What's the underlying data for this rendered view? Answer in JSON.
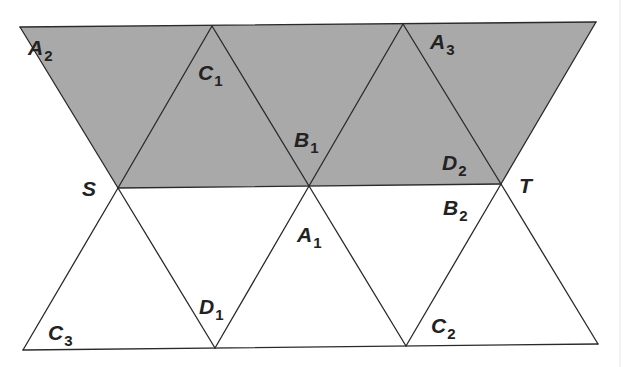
{
  "figure": {
    "colors": {
      "shade": "#a9a9a9",
      "line": "#2a2a2a",
      "text": "#222222",
      "background": "#ffffff"
    },
    "vertices": {
      "top_left": [
        20,
        27
      ],
      "top_apex_1": [
        212,
        26
      ],
      "top_apex_2": [
        403,
        24
      ],
      "top_right": [
        596,
        22
      ],
      "S": [
        118,
        188
      ],
      "M": [
        309,
        186
      ],
      "T": [
        501,
        184
      ],
      "bottom_left": [
        23,
        350
      ],
      "bottom_1": [
        215,
        348
      ],
      "bottom_2": [
        406,
        346
      ],
      "bottom_right": [
        598,
        344
      ]
    },
    "labels": [
      {
        "id": "A2",
        "letter": "A",
        "sub": "2",
        "x": 28,
        "y": 55
      },
      {
        "id": "C1",
        "letter": "C",
        "sub": "1",
        "x": 198,
        "y": 80
      },
      {
        "id": "B1",
        "letter": "B",
        "sub": "1",
        "x": 294,
        "y": 147
      },
      {
        "id": "A3",
        "letter": "A",
        "sub": "3",
        "x": 430,
        "y": 49
      },
      {
        "id": "D2",
        "letter": "D",
        "sub": "2",
        "x": 442,
        "y": 170
      },
      {
        "id": "S",
        "letter": "S",
        "sub": "",
        "x": 82,
        "y": 196
      },
      {
        "id": "T",
        "letter": "T",
        "sub": "",
        "x": 519,
        "y": 193
      },
      {
        "id": "B2",
        "letter": "B",
        "sub": "2",
        "x": 443,
        "y": 215
      },
      {
        "id": "A1",
        "letter": "A",
        "sub": "1",
        "x": 297,
        "y": 242
      },
      {
        "id": "D1",
        "letter": "D",
        "sub": "1",
        "x": 199,
        "y": 314
      },
      {
        "id": "C3",
        "letter": "C",
        "sub": "3",
        "x": 48,
        "y": 340
      },
      {
        "id": "C2",
        "letter": "C",
        "sub": "2",
        "x": 431,
        "y": 333
      }
    ]
  }
}
